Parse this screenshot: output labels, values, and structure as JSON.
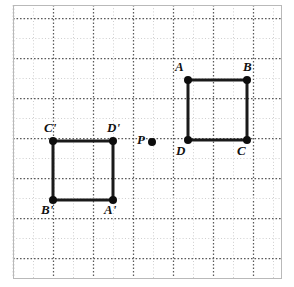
{
  "figure": {
    "canvas": {
      "width": 294,
      "height": 287,
      "background": "#ffffff"
    },
    "frame": {
      "x": 13,
      "y": 5,
      "width": 268,
      "height": 273,
      "border_color": "#b9b9b9"
    },
    "grid": {
      "spacing": 20,
      "minor_color": "#cfcfcf",
      "major_color": "#5a5a5a",
      "major_every": 2,
      "style": "dotted",
      "origin_x": 13,
      "origin_y": 18
    },
    "style": {
      "shape_stroke": "#1a1a1a",
      "shape_stroke_width": 3,
      "vertex_dot_radius": 4,
      "vertex_dot_color": "#0d0d0d",
      "label_color": "#111111"
    }
  },
  "shapes": [
    {
      "name": "square-abcd",
      "id": "preimage",
      "vertices": [
        {
          "label": "A",
          "x": 188,
          "y": 80,
          "label_dx": -13,
          "label_dy": -20
        },
        {
          "label": "B",
          "x": 247,
          "y": 80,
          "label_dx": -4,
          "label_dy": -20
        },
        {
          "label": "C",
          "x": 247,
          "y": 140,
          "label_dx": -10,
          "label_dy": 4
        },
        {
          "label": "D",
          "x": 188,
          "y": 140,
          "label_dx": -12,
          "label_dy": 4
        }
      ]
    },
    {
      "name": "square-a-prime-b-prime-c-prime-d-prime",
      "id": "image",
      "vertices": [
        {
          "label": "C'",
          "x": 53,
          "y": 141,
          "label_dx": -9,
          "label_dy": -20
        },
        {
          "label": "D'",
          "x": 113,
          "y": 141,
          "label_dx": -6,
          "label_dy": -20
        },
        {
          "label": "A'",
          "x": 113,
          "y": 200,
          "label_dx": -9,
          "label_dy": 3
        },
        {
          "label": "B'",
          "x": 53,
          "y": 200,
          "label_dx": -12,
          "label_dy": 3
        }
      ]
    }
  ],
  "points": [
    {
      "name": "center-of-rotation",
      "label": "P",
      "x": 152,
      "y": 142,
      "label_dx": -15,
      "label_dy": -9,
      "radius": 4
    }
  ]
}
